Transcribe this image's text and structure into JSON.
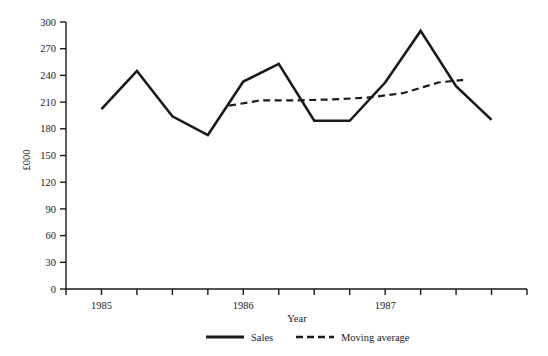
{
  "chart_data": {
    "type": "line",
    "title": "",
    "xlabel": "Year",
    "ylabel": "£000",
    "ylim": [
      0,
      300
    ],
    "ytick_step": 30,
    "yticks": [
      "0",
      "30",
      "60",
      "90",
      "120",
      "150",
      "180",
      "210",
      "240",
      "270",
      "300"
    ],
    "xticks": [
      "1985",
      "1986",
      "1987"
    ],
    "xtick_count": 14,
    "grid": false,
    "legend_position": "bottom-center",
    "x": [
      0,
      1,
      2,
      3,
      4,
      5,
      6,
      7,
      8,
      9,
      10,
      11
    ],
    "series": [
      {
        "name": "Sales",
        "style": "solid",
        "color": "#1a1a1a",
        "values": [
          202,
          245,
          194,
          173,
          233,
          253,
          189,
          189,
          232,
          290,
          228,
          190
        ]
      },
      {
        "name": "Moving average",
        "style": "dashed",
        "color": "#1a1a1a",
        "x": [
          3.6,
          4.5,
          5.5,
          6.5,
          7.5,
          8.5,
          9.5,
          10.2
        ],
        "values": [
          206,
          212,
          212,
          213,
          215,
          220,
          232,
          235
        ]
      }
    ]
  },
  "axes": {
    "y_label": "£000",
    "x_label": "Year"
  },
  "legend": {
    "items": [
      {
        "label": "Sales",
        "style": "solid"
      },
      {
        "label": "Moving average",
        "style": "dashed"
      }
    ]
  }
}
